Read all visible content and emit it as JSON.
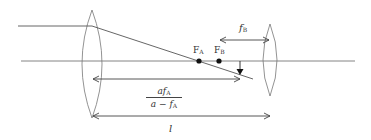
{
  "diagram": {
    "type": "optical ray diagram (two-lens system)",
    "elements": {
      "lens_a": {
        "label": "",
        "shape": "biconvex lens"
      },
      "lens_b": {
        "label": "",
        "shape": "biconvex lens"
      },
      "optical_axis": {
        "label": ""
      },
      "incoming_ray": {
        "label": ""
      },
      "focal_points": [
        {
          "name": "F",
          "sub": "A"
        },
        {
          "name": "F",
          "sub": "B"
        }
      ]
    },
    "labels": {
      "fB": {
        "main": "f",
        "sub": "B"
      },
      "FA": {
        "main": "F",
        "sub": "A"
      },
      "FB": {
        "main": "F",
        "sub": "B"
      },
      "image_distance": {
        "numerator": {
          "a": "a",
          "f": "f",
          "sub": "A"
        },
        "denominator": {
          "a": "a",
          "minus": " − ",
          "f": "f",
          "sub": "A"
        }
      },
      "l": "l"
    },
    "colors": {
      "line": "#555555",
      "lens": "#777777",
      "dot": "#111111",
      "text": "#333333"
    }
  }
}
